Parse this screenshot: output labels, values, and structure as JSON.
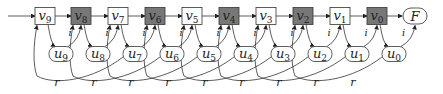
{
  "diagram": {
    "v_nodes": [
      {
        "label": "v9",
        "base": "v",
        "sub": "9",
        "x": 45,
        "shaded": false
      },
      {
        "label": "v8",
        "base": "v",
        "sub": "8",
        "x": 81,
        "shaded": true
      },
      {
        "label": "v7",
        "base": "v",
        "sub": "7",
        "x": 118,
        "shaded": false
      },
      {
        "label": "v6",
        "base": "v",
        "sub": "6",
        "x": 155,
        "shaded": true
      },
      {
        "label": "v5",
        "base": "v",
        "sub": "5",
        "x": 192,
        "shaded": false
      },
      {
        "label": "v4",
        "base": "v",
        "sub": "4",
        "x": 229,
        "shaded": true
      },
      {
        "label": "v3",
        "base": "v",
        "sub": "3",
        "x": 266,
        "shaded": false
      },
      {
        "label": "v2",
        "base": "v",
        "sub": "2",
        "x": 303,
        "shaded": true
      },
      {
        "label": "v1",
        "base": "v",
        "sub": "1",
        "x": 340,
        "shaded": false
      },
      {
        "label": "v0",
        "base": "v",
        "sub": "0",
        "x": 377,
        "shaded": true
      }
    ],
    "u_nodes": [
      {
        "label": "u9",
        "base": "u",
        "sub": "9",
        "x": 61
      },
      {
        "label": "u8",
        "base": "u",
        "sub": "8",
        "x": 98
      },
      {
        "label": "u7",
        "base": "u",
        "sub": "7",
        "x": 135
      },
      {
        "label": "u6",
        "base": "u",
        "sub": "6",
        "x": 172
      },
      {
        "label": "u5",
        "base": "u",
        "sub": "5",
        "x": 209
      },
      {
        "label": "u4",
        "base": "u",
        "sub": "4",
        "x": 246
      },
      {
        "label": "u3",
        "base": "u",
        "sub": "3",
        "x": 283
      },
      {
        "label": "u2",
        "base": "u",
        "sub": "2",
        "x": 320
      },
      {
        "label": "u1",
        "base": "u",
        "sub": "1",
        "x": 357
      },
      {
        "label": "u0",
        "base": "u",
        "sub": "0",
        "x": 394
      }
    ],
    "final_node": {
      "label": "F",
      "x": 415
    },
    "edge_label_i": "i",
    "edge_label_r": "r",
    "r_label_count": 9,
    "colors": {
      "shaded": "#777777",
      "stroke": "#333333",
      "fill": "#ffffff"
    }
  }
}
